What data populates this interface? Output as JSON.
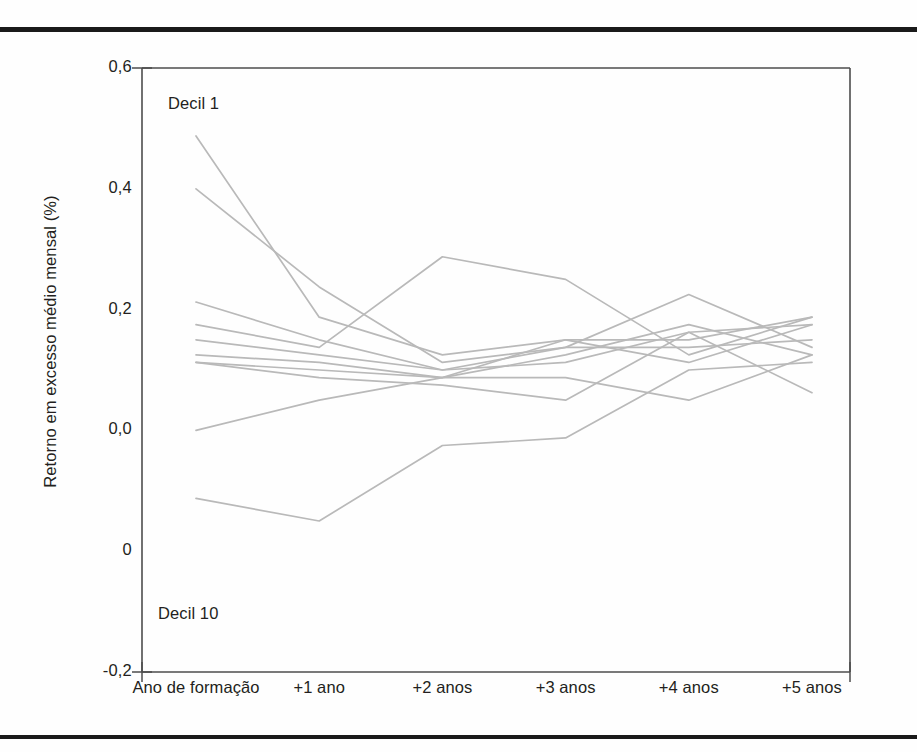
{
  "figure": {
    "background_color": "#fefefe",
    "rule_color": "#1a1a1a",
    "line_color": "#b9b9b9",
    "axis_color": "#4d4d4d"
  },
  "annotations": [
    {
      "name": "decil-1",
      "text": "Decil 1"
    },
    {
      "name": "decil-10",
      "text": "Decil 10"
    }
  ],
  "chart_data": {
    "type": "line",
    "title": "",
    "subtitle": "",
    "xlabel": "",
    "ylabel": "Retorno em excesso médio mensal (%)",
    "grid": false,
    "legend": "none",
    "legend_position": "none",
    "x": [
      "Ano de formação",
      "+1 ano",
      "+2 anos",
      "+3 anos",
      "+4 anos",
      "+5 anos"
    ],
    "xtick_labels": [
      "Ano de formação",
      "+1 ano",
      "+2 anos",
      "+3 anos",
      "+4 anos",
      "+5 anos"
    ],
    "ytick_labels": [
      "0,6",
      "0,4",
      "0,2",
      "0,0",
      "0",
      "-0,2"
    ],
    "ytick_values": [
      0.6,
      0.4,
      0.2,
      0.0,
      -0.1,
      -0.2
    ],
    "ylim": [
      -0.2,
      0.6
    ],
    "xlim": [
      0,
      5
    ],
    "annotations": [
      {
        "text": "Decil 1",
        "x": 0,
        "y": 0.56
      },
      {
        "text": "Decil 10",
        "x": 0,
        "y": -0.13
      }
    ],
    "series": [
      {
        "name": "Decil 1",
        "values": [
          0.51,
          0.27,
          0.22,
          0.24,
          0.24,
          0.27
        ]
      },
      {
        "name": "Decil 2",
        "values": [
          0.44,
          0.31,
          0.21,
          0.23,
          0.3,
          0.23
        ]
      },
      {
        "name": "Decil 3",
        "values": [
          0.29,
          0.24,
          0.2,
          0.21,
          0.25,
          0.26
        ]
      },
      {
        "name": "Decil 4",
        "values": [
          0.26,
          0.23,
          0.35,
          0.32,
          0.22,
          0.27
        ]
      },
      {
        "name": "Decil 5",
        "values": [
          0.24,
          0.22,
          0.2,
          0.23,
          0.23,
          0.24
        ]
      },
      {
        "name": "Decil 6",
        "values": [
          0.22,
          0.21,
          0.19,
          0.22,
          0.26,
          0.22
        ]
      },
      {
        "name": "Decil 7",
        "values": [
          0.21,
          0.2,
          0.19,
          0.24,
          0.21,
          0.26
        ]
      },
      {
        "name": "Decil 8",
        "values": [
          0.21,
          0.19,
          0.18,
          0.16,
          0.25,
          0.17
        ]
      },
      {
        "name": "Decil 9",
        "values": [
          0.12,
          0.16,
          0.19,
          0.19,
          0.16,
          0.22
        ]
      },
      {
        "name": "Decil 10",
        "values": [
          0.03,
          0.0,
          0.1,
          0.11,
          0.2,
          0.21
        ]
      }
    ]
  }
}
